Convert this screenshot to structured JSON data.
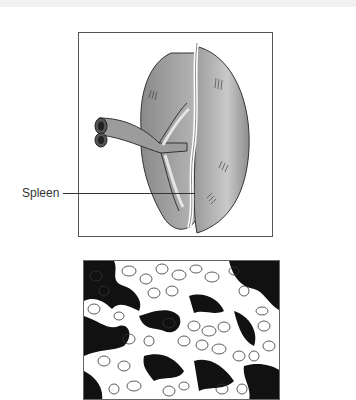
{
  "figure": {
    "top_panel": {
      "description": "Illustration of the spleen with splenic vessels",
      "label": "Spleen"
    },
    "bottom_panel": {
      "description": "Microscopic view of splenic tissue showing densely packed cells and dark trabecular network"
    },
    "colors": {
      "organ_dark": "#7a7a7a",
      "organ_mid": "#a9a9a9",
      "organ_light": "#d8d8d8",
      "outline": "#333333",
      "tissue_dark": "#111111",
      "cell_outline": "#333333"
    }
  }
}
